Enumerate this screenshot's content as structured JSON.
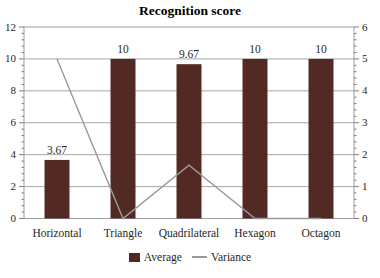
{
  "chart_data": {
    "type": "bar",
    "subtype": "bar-line-combo",
    "title": "Recognition score",
    "categories": [
      "Horizontal",
      "Triangle",
      "Quadrilateral",
      "Hexagon",
      "Octagon"
    ],
    "series": [
      {
        "name": "Average",
        "chart": "bar",
        "axis": "left",
        "values": [
          3.67,
          10,
          9.67,
          10,
          10
        ],
        "data_labels": [
          "3.67",
          "10",
          "9.67",
          "10",
          "10"
        ],
        "color": "#532a23"
      },
      {
        "name": "Variance",
        "chart": "line",
        "axis": "right",
        "values": [
          5,
          0,
          1.67,
          0,
          0
        ],
        "color": "#9a9a9a"
      }
    ],
    "left_axis": {
      "min": 0,
      "max": 12,
      "major_step": 2,
      "minor_step": 0.4,
      "tick_labels": [
        "0",
        "2",
        "4",
        "6",
        "8",
        "10",
        "12"
      ]
    },
    "right_axis": {
      "min": 0,
      "max": 6,
      "major_step": 1,
      "minor_step": 0.2,
      "tick_labels": [
        "0",
        "1",
        "2",
        "3",
        "4",
        "5",
        "6"
      ]
    },
    "legend_position": "bottom",
    "grid": "horizontal-major"
  }
}
